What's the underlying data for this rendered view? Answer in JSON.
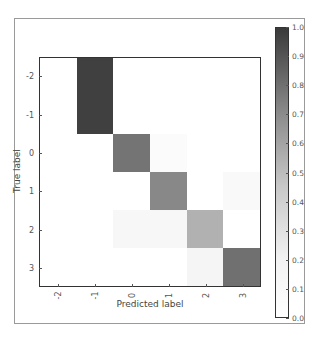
{
  "chart_data": {
    "type": "heatmap",
    "title": "",
    "xlabel": "Predicted label",
    "ylabel": "True label",
    "x_categories": [
      "-2",
      "-1",
      "0",
      "1",
      "2",
      "3"
    ],
    "y_categories": [
      "-2",
      "-1",
      "0",
      "1",
      "2",
      "3"
    ],
    "matrix": [
      [
        0.0,
        0.93,
        0.0,
        0.0,
        0.0,
        0.0
      ],
      [
        0.0,
        0.93,
        0.0,
        0.0,
        0.0,
        0.0
      ],
      [
        0.0,
        0.0,
        0.68,
        0.02,
        0.0,
        0.0
      ],
      [
        0.0,
        0.0,
        0.0,
        0.58,
        0.0,
        0.03
      ],
      [
        0.0,
        0.0,
        0.04,
        0.04,
        0.38,
        0.0
      ],
      [
        0.0,
        0.0,
        0.0,
        0.0,
        0.05,
        0.7
      ]
    ],
    "colorbar": {
      "range": [
        0.0,
        1.0
      ],
      "ticks": [
        "0.0",
        "0.1",
        "0.2",
        "0.3",
        "0.4",
        "0.5",
        "0.6",
        "0.7",
        "0.8",
        "0.9",
        "1.0"
      ],
      "colormap": "Greys"
    },
    "grid": false,
    "legend": "colorbar right"
  }
}
